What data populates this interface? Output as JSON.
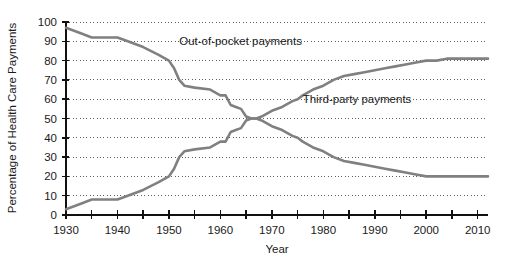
{
  "chart_data": {
    "type": "line",
    "title": "",
    "xlabel": "Year",
    "ylabel": "Percentage of Health Care Payments",
    "xlim": [
      1930,
      2012
    ],
    "ylim": [
      0,
      100
    ],
    "grid": true,
    "legend_position": "inline-annotations",
    "x_ticks_major": [
      1930,
      1940,
      1950,
      1960,
      1970,
      1980,
      1990,
      2000,
      2010
    ],
    "x_ticks_minor": [
      1935,
      1945,
      1955,
      1965,
      1975,
      1985,
      1995,
      2005
    ],
    "x_tick_labels": [
      "1930",
      "1940",
      "1950",
      "1960",
      "1970",
      "1980",
      "1990",
      "2000",
      "2010"
    ],
    "y_ticks": [
      0,
      10,
      20,
      30,
      40,
      50,
      60,
      70,
      80,
      90,
      100
    ],
    "y_tick_labels": [
      "0",
      "10",
      "20",
      "30",
      "40",
      "50",
      "60",
      "70",
      "80",
      "90",
      "100"
    ],
    "series": [
      {
        "name": "Out-of-pocket payments",
        "color": "#808080",
        "label_x": 1952,
        "label_y": 88,
        "x": [
          1930,
          1933,
          1935,
          1940,
          1942,
          1945,
          1948,
          1950,
          1951,
          1952,
          1953,
          1955,
          1958,
          1960,
          1961,
          1962,
          1963,
          1964,
          1965,
          1966,
          1967,
          1968,
          1970,
          1972,
          1974,
          1975,
          1976,
          1978,
          1980,
          1982,
          1984,
          1986,
          1988,
          1990,
          1992,
          1994,
          1996,
          1998,
          2000,
          2002,
          2004,
          2006,
          2008,
          2010,
          2012
        ],
        "values": [
          97,
          94,
          92,
          92,
          90,
          87,
          83,
          80,
          76,
          70,
          67,
          66,
          65,
          62,
          62,
          57,
          56,
          55,
          51,
          50,
          50,
          49,
          46,
          44,
          41,
          40,
          38,
          35,
          33,
          30,
          28,
          27,
          26,
          25,
          24,
          23,
          22,
          21,
          20,
          20,
          20,
          20,
          20,
          20,
          20
        ]
      },
      {
        "name": "Third-party payments",
        "color": "#808080",
        "label_x": 1976,
        "label_y": 58,
        "x": [
          1930,
          1933,
          1935,
          1940,
          1942,
          1945,
          1948,
          1950,
          1951,
          1952,
          1953,
          1955,
          1958,
          1960,
          1961,
          1962,
          1963,
          1964,
          1965,
          1966,
          1967,
          1968,
          1970,
          1972,
          1974,
          1975,
          1976,
          1978,
          1980,
          1982,
          1984,
          1986,
          1988,
          1990,
          1992,
          1994,
          1996,
          1998,
          2000,
          2002,
          2004,
          2006,
          2008,
          2010,
          2012
        ],
        "values": [
          3,
          6,
          8,
          8,
          10,
          13,
          17,
          20,
          24,
          30,
          33,
          34,
          35,
          38,
          38,
          43,
          44,
          45,
          49,
          50,
          50,
          51,
          54,
          56,
          59,
          60,
          62,
          65,
          67,
          70,
          72,
          73,
          74,
          75,
          76,
          77,
          78,
          79,
          80,
          80,
          81,
          81,
          81,
          81,
          81
        ]
      }
    ]
  },
  "labels": {
    "series_0": "Out-of-pocket payments",
    "series_1": "Third-party payments",
    "x_axis_title": "Year",
    "y_axis_title": "Percentage of Health Care Payments"
  }
}
